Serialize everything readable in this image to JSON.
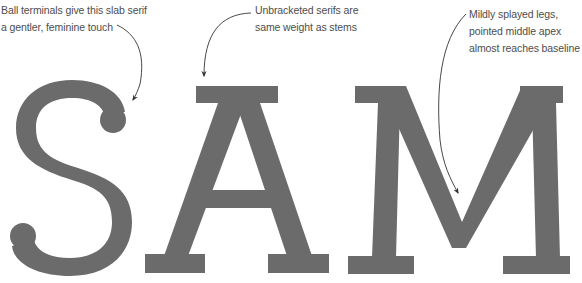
{
  "title_word": "SAM",
  "colors": {
    "letter_fill": "#6b6b6b",
    "annotation_text": "#4d4d4d",
    "arrow": "#333333",
    "background": "#ffffff"
  },
  "letters": [
    {
      "glyph": "S",
      "feature": "ball terminals"
    },
    {
      "glyph": "A",
      "feature": "unbracketed serifs"
    },
    {
      "glyph": "M",
      "feature": "splayed legs, pointed middle apex"
    }
  ],
  "annotations": {
    "s": {
      "lines": [
        "Ball terminals give this slab serif",
        "a gentler, feminine touch"
      ],
      "points_to": "S upper ball terminal"
    },
    "a": {
      "lines": [
        "Unbracketed serifs are",
        "same weight as stems"
      ],
      "points_to": "A top serif"
    },
    "m": {
      "lines": [
        "Mildly splayed legs,",
        "pointed middle apex",
        "almost reaches baseline"
      ],
      "points_to": "M middle apex"
    }
  }
}
